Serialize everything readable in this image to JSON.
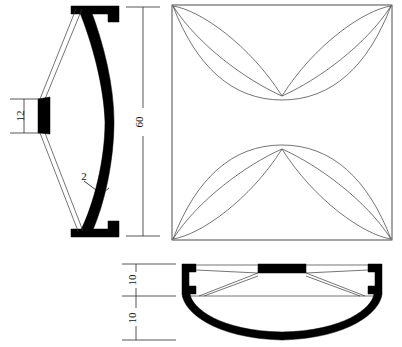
{
  "drawing": {
    "title": "Engineering Part Drawing — Sectional Elevation, Plan and Bottom Section",
    "background_color": "#ffffff",
    "line_color": "#1a1a1a",
    "hatch_color": "#000000",
    "thin_line_color": "#3a3a3a",
    "views": {
      "left_elevation": {
        "name": "Sectional Side Elevation",
        "dimensions": [
          {
            "id": "dim-12",
            "label": "12",
            "orientation": "vertical",
            "placement": "left",
            "units": ""
          },
          {
            "id": "dim-2",
            "label": "2",
            "orientation": "leader",
            "placement": "wall-thickness",
            "units": ""
          }
        ]
      },
      "overall_height": {
        "name": "Overall Height Dimension",
        "dimensions": [
          {
            "id": "dim-60",
            "label": "60",
            "orientation": "vertical",
            "placement": "between-views",
            "units": ""
          }
        ]
      },
      "plan": {
        "name": "Plan View",
        "shape": "square",
        "petal_count": 4,
        "pattern": "four-petal cross"
      },
      "bottom_section": {
        "name": "Bottom Sectional View",
        "dimensions": [
          {
            "id": "dim-10-upper",
            "label": "10",
            "orientation": "vertical",
            "placement": "left-upper",
            "units": ""
          },
          {
            "id": "dim-10-lower",
            "label": "10",
            "orientation": "vertical",
            "placement": "left-lower",
            "units": ""
          }
        ]
      }
    },
    "labels": {
      "twelve": "12",
      "sixty": "60",
      "two": "2",
      "ten_upper": "10",
      "ten_lower": "10"
    }
  }
}
